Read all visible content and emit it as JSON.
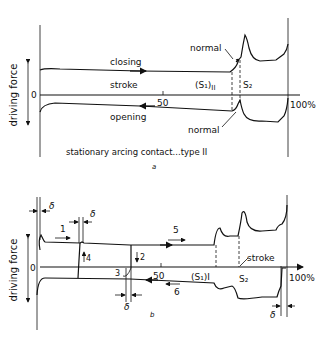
{
  "panel_a": {
    "ylabel": "driving force",
    "zero": "0",
    "tick_50": "50",
    "tick_100": "100%",
    "closing": "closing",
    "stroke": "stroke",
    "opening": "opening",
    "normal_top": "normal",
    "normal_bottom": "normal",
    "s1": "(S₁)",
    "s1_sub": "II",
    "s2": "S₂",
    "caption": "stationary arcing contact...type II",
    "letter": "a"
  },
  "panel_b": {
    "ylabel": "driving force",
    "zero": "0",
    "tick_50": "50",
    "tick_100": "100%",
    "stroke": "stroke",
    "s1": "(S₁)I",
    "s2": "S₂",
    "delta": "δ",
    "n1": "1",
    "n2": "2",
    "n3": "3",
    "n4": "4",
    "n5": "5",
    "n6": "6",
    "letter": "b"
  }
}
